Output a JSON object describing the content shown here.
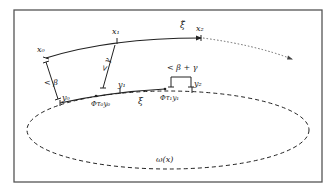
{
  "diagram": {
    "frame": {
      "x": 14,
      "y": 10,
      "width": 308,
      "height": 172
    },
    "colors": {
      "stroke": "#222222",
      "frame": "#555555",
      "dotted": "#666666"
    },
    "labels": {
      "x0": "x₀",
      "x1": "x₁",
      "x2": "x₂",
      "xi_tilde": "ξ̃",
      "y0": "y₀",
      "y1": "y₁",
      "y2": "y₂",
      "xi": "ξ",
      "phi_tau0_y0": "Φτ₀y₀",
      "phi_tau1_y1": "Φτ₁y₁",
      "lt_beta": "< β",
      "lt_gamma": "< γ",
      "lt_beta_gamma": "< β + γ",
      "omega_x": "ω(x)"
    }
  }
}
